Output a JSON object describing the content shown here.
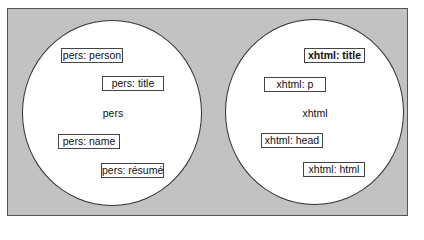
{
  "diagram": {
    "type": "namespace-venn",
    "namespaces": [
      {
        "name": "pers",
        "elements": [
          "pers: person",
          "pers: title",
          "pers: name",
          "pers: résumé"
        ]
      },
      {
        "name": "xhtml",
        "elements": [
          "xhtml: title",
          "xhtml: p",
          "xhtml: head",
          "xhtml: html"
        ],
        "highlighted": "xhtml: title"
      }
    ]
  },
  "colors": {
    "background": "#c2c2c2",
    "circle_fill": "#ffffff",
    "border": "#333333"
  }
}
